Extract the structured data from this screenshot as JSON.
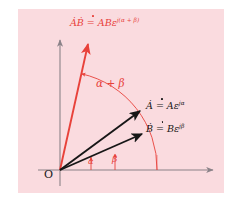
{
  "figure": {
    "background_color": "#fadbdf",
    "page_color": "#ffffff",
    "vector_color": "#171717",
    "product_color": "#e8413a",
    "axis_color": "#8a8288",
    "origin_label": "O",
    "labels": {
      "product": "ȦḂ = ABε",
      "product_exponent": "j(α + β)",
      "vector_a": "Ȧ = Aε",
      "vector_a_exponent": "jα",
      "vector_b": "Ḃ = Bε",
      "vector_b_exponent": "jβ",
      "angle_sum": "α + β",
      "angle_alpha": "α",
      "angle_beta": "β"
    },
    "geometry": {
      "origin": [
        60,
        170
      ],
      "x_axis_end": [
        216,
        170
      ],
      "y_axis_top": [
        60,
        37
      ],
      "vector_a_tip": [
        143,
        108
      ],
      "vector_b_tip": [
        145,
        132
      ],
      "product_tip": [
        88,
        41
      ],
      "arc_sum_radius": 97,
      "arc_alpha_radius": 31,
      "arc_beta_radius": 55
    }
  }
}
